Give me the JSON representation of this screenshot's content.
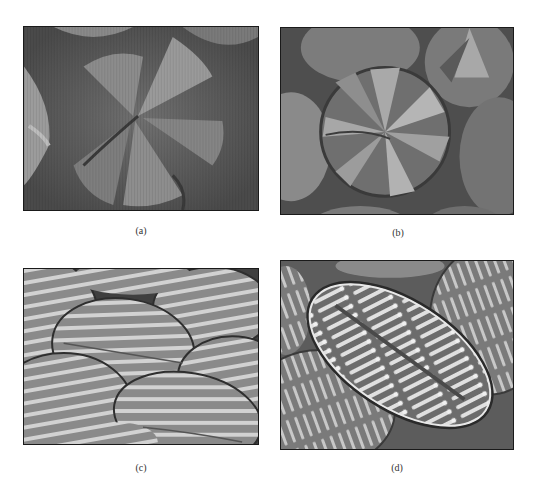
{
  "figure": {
    "panels": [
      {
        "id": "a",
        "caption": "(a)",
        "description": "Micrograph showing blurred radial fan-like sectors of overlapping circular domains, dark background with vertical scan lines"
      },
      {
        "id": "b",
        "caption": "(b)",
        "description": "Micrograph of a central circular domain with radial pinwheel-like bright and dark sectors, surrounded by neighboring domains"
      },
      {
        "id": "c",
        "caption": "(c)",
        "description": "Micrograph of several elliptical domains with periodic light/dark banded stripes perpendicular to a central axis"
      },
      {
        "id": "d",
        "caption": "(d)",
        "description": "Micrograph of an elongated oval domain with regularly spaced finger-like stripes ending in dots along a central spine"
      }
    ]
  },
  "colors": {
    "background": "#ffffff",
    "frame": "#1a1a1a",
    "caption_text": "#333333"
  }
}
